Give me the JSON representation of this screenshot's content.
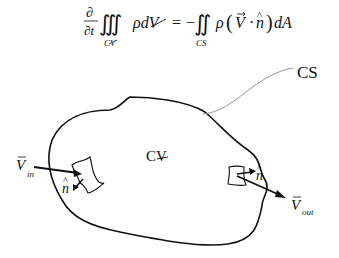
{
  "equation": {
    "partial_top": "∂",
    "partial_bottom": "∂t",
    "lhs_integral": "∭",
    "lhs_integrand": "ρdV",
    "lhs_subscript": "CV",
    "equals": "=",
    "minus": "−",
    "rhs_integral": "∬",
    "rhs_subscript": "CS",
    "rhs_integrand_rho": "ρ",
    "rhs_lparen": "(",
    "rhs_V": "V",
    "rhs_dot": "·",
    "rhs_n": "n",
    "rhs_rparen": ")",
    "rhs_dA": "dA"
  },
  "labels": {
    "control_surface": "CS",
    "control_volume": "CV",
    "v_in_main": "V",
    "v_in_sub": "in",
    "v_out_main": "V",
    "v_out_sub": "out",
    "n_hat_left": "n",
    "n_hat_right": "n"
  },
  "colors": {
    "stroke": "#111111",
    "leader_line": "#888888",
    "background": "#ffffff"
  }
}
